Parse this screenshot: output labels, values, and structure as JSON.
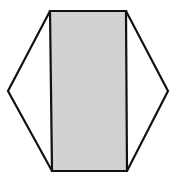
{
  "diagram": {
    "canvas": {
      "width": 180,
      "height": 178
    },
    "colors": {
      "stroke": "#111111",
      "fill_shaded": "#d2d2d2",
      "fill_background": "#ffffff"
    },
    "stroke_width": 2.2,
    "hexagon": {
      "points": "50,11 126,11 168,91 127,171 52,171 8,91"
    },
    "rectangle": {
      "points": "50,11 126,11 127,171 52,171"
    }
  }
}
